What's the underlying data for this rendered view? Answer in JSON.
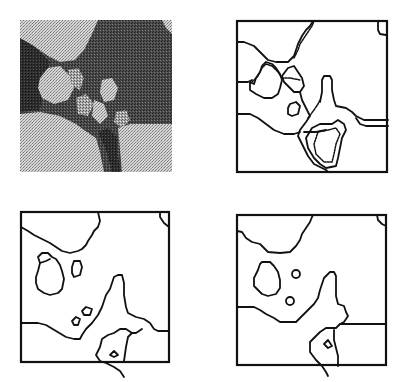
{
  "figure": {
    "panels": [
      {
        "id": "original-image",
        "kind": "grayscale-halftone-photo"
      },
      {
        "id": "segmentation-fine",
        "kind": "contour-map",
        "detail": "noisy boundaries with doubled edges"
      },
      {
        "id": "segmentation-medium",
        "kind": "contour-map",
        "detail": "smoothed boundaries with small regions"
      },
      {
        "id": "segmentation-coarse",
        "kind": "contour-map",
        "detail": "smoothest boundaries, small regions reduced to dots"
      }
    ],
    "colors": {
      "background": "#ffffff",
      "stroke": "#111111",
      "photo_dark": "#3a3a3a",
      "photo_light": "#bdbdbd"
    }
  }
}
